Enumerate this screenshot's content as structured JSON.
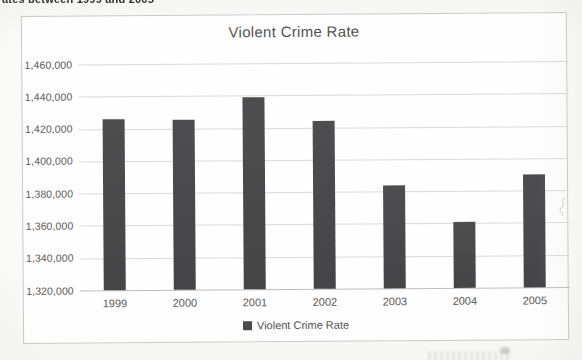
{
  "page": {
    "clipped_header_fragment": "ates between 1999 and 2005"
  },
  "chart": {
    "title": "Violent Crime Rate",
    "legend": {
      "label": "Violent Crime Rate",
      "marker_color": "#4a4a4c",
      "position": "bottom"
    }
  },
  "chart_data": {
    "type": "bar",
    "title": "Violent Crime Rate",
    "series_name": "Violent Crime Rate",
    "categories": [
      "1999",
      "2000",
      "2001",
      "2002",
      "2003",
      "2004",
      "2005"
    ],
    "values": [
      1426000,
      1425500,
      1439000,
      1424000,
      1384000,
      1361000,
      1390000
    ],
    "xlabel": "",
    "ylabel": "",
    "ylim": [
      1320000,
      1460000
    ],
    "ytick_step": 20000,
    "ytick_labels": [
      "1,460,000",
      "1,440,000",
      "1,420,000",
      "1,400,000",
      "1,380,000",
      "1,360,000",
      "1,340,000",
      "1,320,000"
    ],
    "grid": true,
    "legend_position": "bottom",
    "bar_color": "#4a4a4c",
    "gridline_color": "#d9d9d7",
    "text_color": "#585856"
  }
}
